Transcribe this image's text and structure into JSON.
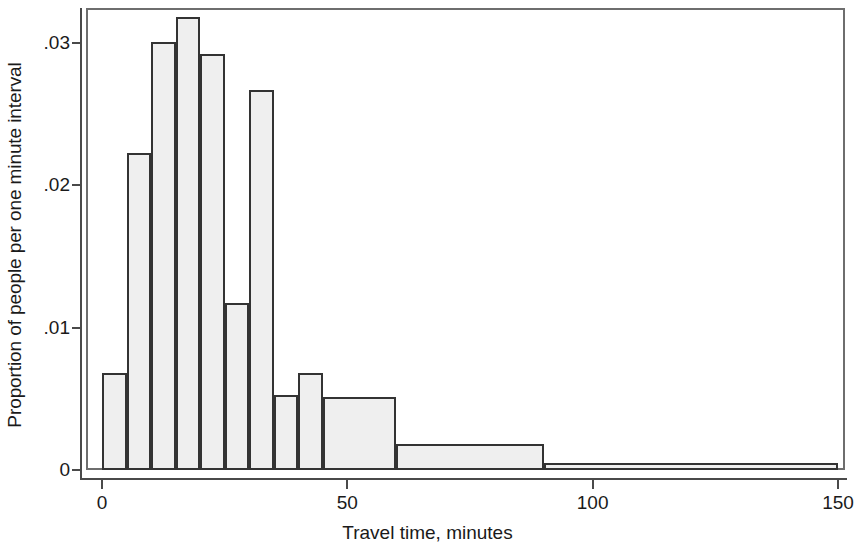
{
  "chart_data": {
    "type": "bar",
    "title": "",
    "xlabel": "Travel time, minutes",
    "ylabel": "Proportion of people per one minute interval",
    "xlim": [
      0,
      150
    ],
    "ylim": [
      0,
      0.0335
    ],
    "grid": false,
    "legend": null,
    "xticks": [
      {
        "value": 0,
        "label": "0"
      },
      {
        "value": 50,
        "label": "50"
      },
      {
        "value": 100,
        "label": "100"
      },
      {
        "value": 150,
        "label": "150"
      }
    ],
    "yticks": [
      {
        "value": 0,
        "label": "0"
      },
      {
        "value": 0.01,
        "label": ".01"
      },
      {
        "value": 0.02,
        "label": ".02"
      },
      {
        "value": 0.03,
        "label": ".03"
      }
    ],
    "bins": [
      {
        "x0": 0,
        "x1": 5,
        "value": 0.0068
      },
      {
        "x0": 5,
        "x1": 10,
        "value": 0.0223
      },
      {
        "x0": 10,
        "x1": 15,
        "value": 0.0301
      },
      {
        "x0": 15,
        "x1": 20,
        "value": 0.0318
      },
      {
        "x0": 20,
        "x1": 25,
        "value": 0.0292
      },
      {
        "x0": 25,
        "x1": 30,
        "value": 0.0117
      },
      {
        "x0": 30,
        "x1": 35,
        "value": 0.0267
      },
      {
        "x0": 35,
        "x1": 40,
        "value": 0.0053
      },
      {
        "x0": 40,
        "x1": 45,
        "value": 0.0068
      },
      {
        "x0": 45,
        "x1": 60,
        "value": 0.0051
      },
      {
        "x0": 60,
        "x1": 90,
        "value": 0.0018
      },
      {
        "x0": 90,
        "x1": 150,
        "value": 0.0005
      }
    ],
    "colors": {
      "bar_fill": "#efefef",
      "bar_edge": "#333333",
      "frame": "#6e6e6e",
      "text": "#1a1a1a"
    }
  },
  "layout": {
    "plot_left": 86,
    "plot_top": 8,
    "plot_right": 845,
    "plot_bottom": 470,
    "x0_px": 102,
    "x150_px": 838,
    "y0_px": 470,
    "y03_px": 43
  }
}
